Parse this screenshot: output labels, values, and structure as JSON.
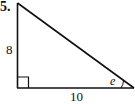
{
  "problem": {
    "number": "5."
  },
  "triangle": {
    "type": "right-triangle",
    "vertical_leg_label": "8",
    "horizontal_leg_label": "10",
    "angle_label": "e",
    "right_angle_marker": true,
    "stroke_color": "#111111"
  }
}
